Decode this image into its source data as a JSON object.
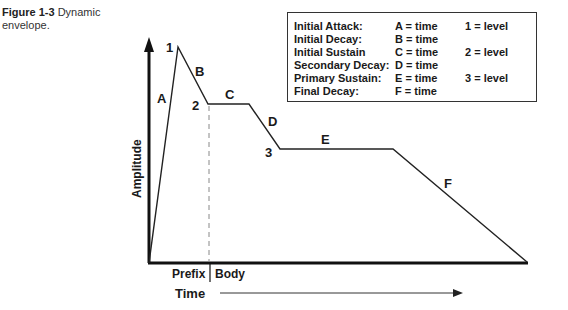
{
  "caption": {
    "figure": "Figure 1-3",
    "text": "Dynamic envelope."
  },
  "legend": {
    "rows": [
      {
        "name": "Initial Attack:",
        "time": "A = time",
        "level": "1 = level"
      },
      {
        "name": "Initial Decay:",
        "time": "B = time",
        "level": ""
      },
      {
        "name": "Initial Sustain",
        "time": "C = time",
        "level": "2 = level"
      },
      {
        "name": "Secondary Decay:",
        "time": "D = time",
        "level": ""
      },
      {
        "name": "Primary Sustain:",
        "time": "E = time",
        "level": "3 = level"
      },
      {
        "name": "Final Decay:",
        "time": "F = time",
        "level": ""
      }
    ]
  },
  "diagram": {
    "y_axis_label": "Amplitude",
    "x_axis_label": "Time",
    "region_labels": {
      "prefix": "Prefix",
      "body": "Body"
    },
    "segment_labels": {
      "A": "A",
      "B": "B",
      "C": "C",
      "D": "D",
      "E": "E",
      "F": "F"
    },
    "level_labels": {
      "1": "1",
      "2": "2",
      "3": "3"
    }
  }
}
